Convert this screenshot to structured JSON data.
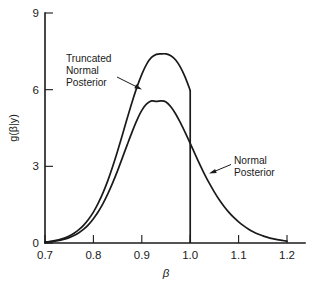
{
  "figure": {
    "background_color": "#ffffff",
    "line_color": "#1a1a1a"
  },
  "chart_data": {
    "type": "line",
    "title": "",
    "subtitle": "",
    "xlabel": "β",
    "ylabel": "g(β|y)",
    "xlim": [
      0.7,
      1.2
    ],
    "ylim": [
      0,
      9
    ],
    "xticks": [
      0.7,
      0.8,
      0.9,
      1.0,
      1.1,
      1.2
    ],
    "xtick_labels": [
      "0.7",
      "0.8",
      "0.9",
      "1.0",
      "1.1",
      "1.2"
    ],
    "yticks": [
      0,
      3,
      6,
      9
    ],
    "ytick_labels": [
      "0",
      "3",
      "6",
      "9"
    ],
    "grid": false,
    "legend": "none",
    "annotations": [
      {
        "id": "truncated-normal-posterior",
        "lines": [
          "Truncated",
          "Normal",
          "Posterior"
        ],
        "text": "Truncated Normal Posterior",
        "text_x_px": 66,
        "text_y_px": 62,
        "arrow_from_px": [
          117,
          77
        ],
        "arrow_to_px": [
          142,
          89
        ]
      },
      {
        "id": "normal-posterior",
        "lines": [
          "Normal",
          "Posterior"
        ],
        "text": "Normal Posterior",
        "text_x_px": 234,
        "text_y_px": 164,
        "arrow_from_px": [
          231,
          164
        ],
        "arrow_to_px": [
          209,
          173
        ]
      }
    ],
    "series": [
      {
        "name": "Truncated Normal Posterior",
        "truncated_at": 1.0,
        "peak_x": 0.95,
        "peak_y": 7.4,
        "x": [
          0.7,
          0.71,
          0.72,
          0.73,
          0.74,
          0.75,
          0.76,
          0.77,
          0.78,
          0.79,
          0.8,
          0.81,
          0.82,
          0.83,
          0.84,
          0.85,
          0.86,
          0.87,
          0.88,
          0.89,
          0.9,
          0.91,
          0.92,
          0.93,
          0.94,
          0.95,
          0.96,
          0.97,
          0.98,
          0.99,
          1.0
        ],
        "y": [
          0.04,
          0.06,
          0.09,
          0.13,
          0.19,
          0.27,
          0.38,
          0.52,
          0.7,
          0.93,
          1.21,
          1.56,
          1.97,
          2.45,
          3.0,
          3.6,
          4.24,
          4.89,
          5.52,
          6.1,
          6.6,
          7.0,
          7.26,
          7.38,
          7.4,
          7.4,
          7.33,
          7.16,
          6.87,
          6.47,
          5.97
        ]
      },
      {
        "name": "Normal Posterior",
        "truncated_at": null,
        "peak_x": 0.95,
        "peak_y": 5.5,
        "x": [
          0.7,
          0.71,
          0.72,
          0.73,
          0.74,
          0.75,
          0.76,
          0.77,
          0.78,
          0.79,
          0.8,
          0.81,
          0.82,
          0.83,
          0.84,
          0.85,
          0.86,
          0.87,
          0.88,
          0.89,
          0.9,
          0.91,
          0.92,
          0.93,
          0.94,
          0.95,
          0.96,
          0.97,
          0.98,
          0.99,
          1.0,
          1.01,
          1.02,
          1.03,
          1.04,
          1.05,
          1.06,
          1.07,
          1.08,
          1.09,
          1.1,
          1.11,
          1.12,
          1.13,
          1.14,
          1.15,
          1.16,
          1.17,
          1.18,
          1.19,
          1.2
        ],
        "y": [
          0.03,
          0.05,
          0.07,
          0.1,
          0.15,
          0.21,
          0.29,
          0.4,
          0.54,
          0.72,
          0.95,
          1.22,
          1.55,
          1.93,
          2.36,
          2.83,
          3.34,
          3.85,
          4.35,
          4.81,
          5.19,
          5.44,
          5.56,
          5.54,
          5.56,
          5.52,
          5.33,
          5.05,
          4.7,
          4.31,
          3.9,
          3.48,
          3.07,
          2.68,
          2.32,
          1.99,
          1.69,
          1.43,
          1.2,
          1.0,
          0.83,
          0.68,
          0.55,
          0.44,
          0.35,
          0.28,
          0.22,
          0.17,
          0.13,
          0.1,
          0.07
        ]
      }
    ]
  },
  "geometry": {
    "plot_left_px": 45,
    "plot_right_px": 287,
    "plot_bottom_px": 243,
    "plot_top_px": 13,
    "axis_overhang_right_px": 18,
    "tick_len_px": 8
  }
}
